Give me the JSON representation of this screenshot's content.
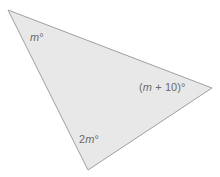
{
  "figure": {
    "name": "triangle-angle-diagram",
    "type": "geometry-diagram",
    "background_color": "#ffffff",
    "shape": {
      "name": "triangle",
      "sides": 3,
      "fill_color": "#e8e8e8",
      "stroke_color": "#a0a0a0",
      "stroke_width": 1,
      "vertices": [
        {
          "name": "top-left-vertex",
          "x": 8,
          "y": 10
        },
        {
          "name": "right-vertex",
          "x": 212,
          "y": 88
        },
        {
          "name": "bottom-vertex",
          "x": 88,
          "y": 170
        }
      ]
    },
    "labels": [
      {
        "name": "angle-label-m",
        "at_vertex": "top-left-vertex",
        "text": "m°",
        "variable": "m",
        "degree_symbol": "°",
        "expression": "m",
        "color": "#6b6b6b",
        "x": 30,
        "y": 32
      },
      {
        "name": "angle-label-m-plus-10",
        "at_vertex": "right-vertex",
        "text": "(m + 10)°",
        "prefix": "(",
        "variable": "m",
        "operator": " + ",
        "constant": "10)",
        "degree_symbol": "°",
        "expression": "(m + 10)",
        "color": "#6b6b6b",
        "x": 139,
        "y": 82
      },
      {
        "name": "angle-label-2m",
        "at_vertex": "bottom-vertex",
        "text": "2m°",
        "coefficient": "2",
        "variable": "m",
        "degree_symbol": "°",
        "expression": "2m",
        "color": "#6b6b6b",
        "x": 79,
        "y": 134
      }
    ]
  }
}
